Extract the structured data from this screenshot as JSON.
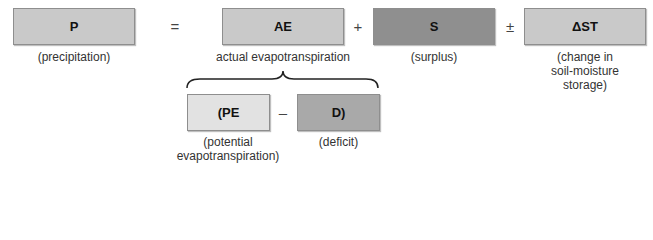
{
  "equation": {
    "terms": [
      {
        "id": "P",
        "symbol": "P",
        "label_lines": [
          "(precipitation)"
        ],
        "color": "#c9c9c9"
      },
      {
        "id": "AE",
        "symbol": "AE",
        "label_lines": [
          "actual evapotranspiration"
        ],
        "color": "#c9c9c9"
      },
      {
        "id": "S",
        "symbol": "S",
        "label_lines": [
          "(surplus)"
        ],
        "color": "#8f8f8f"
      },
      {
        "id": "DST",
        "symbol": "ΔST",
        "label_lines": [
          "(change in",
          "soil-moisture",
          "storage)"
        ],
        "color": "#c9c9c9"
      }
    ],
    "operators": [
      "=",
      "+",
      "±"
    ]
  },
  "expansion": {
    "terms": [
      {
        "id": "PE",
        "symbol": "(PE",
        "label_lines": [
          "(potential",
          "evapotranspiration)"
        ],
        "color": "#e2e2e2"
      },
      {
        "id": "D",
        "symbol": "D)",
        "label_lines": [
          "(deficit)"
        ],
        "color": "#a9a9a9"
      }
    ],
    "operator": "–"
  }
}
